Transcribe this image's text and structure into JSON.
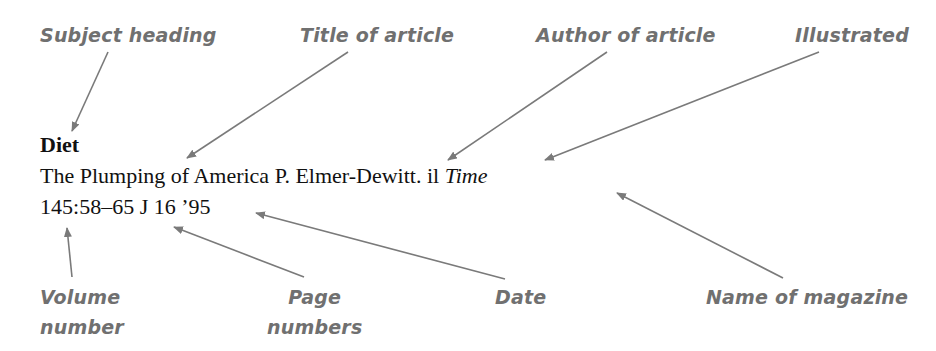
{
  "labels": {
    "subject_heading": "Subject heading",
    "title_of_article": "Title of article",
    "author_of_article": "Author of article",
    "illustrated": "Illustrated",
    "volume_line1": "Volume",
    "volume_line2": "number",
    "page_line1": "Page",
    "page_line2": "numbers",
    "date": "Date",
    "name_of_magazine": "Name of magazine"
  },
  "entry": {
    "subject": "Diet",
    "title": "The Plumping of America",
    "author": "P. Elmer-Dewitt.",
    "illustrated": "il",
    "magazine": "Time",
    "volume": "145",
    "separator": ":",
    "pages": "58–65",
    "date": "J 16 ’95"
  },
  "colors": {
    "label": "#707070",
    "arrow": "#7a7a7a",
    "text": "#111111"
  }
}
